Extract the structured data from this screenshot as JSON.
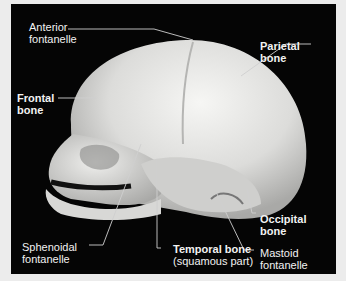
{
  "figure": {
    "labels": {
      "anterior_fontanelle": [
        "Anterior",
        "fontanelle"
      ],
      "parietal_bone": [
        "Parietal",
        "bone"
      ],
      "frontal_bone": [
        "Frontal",
        "bone"
      ],
      "occipital_bone": [
        "Occipital",
        "bone"
      ],
      "sphenoidal_fontanelle": [
        "Sphenoidal",
        "fontanelle"
      ],
      "temporal_bone": [
        "Temporal bone",
        "(squamous part)"
      ],
      "mastoid_fontanelle": [
        "Mastoid",
        "fontanelle"
      ]
    },
    "colors": {
      "background": "#050505",
      "page": "#ececec",
      "bone": "#e8e8e6",
      "text": "#f2f2f2"
    }
  }
}
